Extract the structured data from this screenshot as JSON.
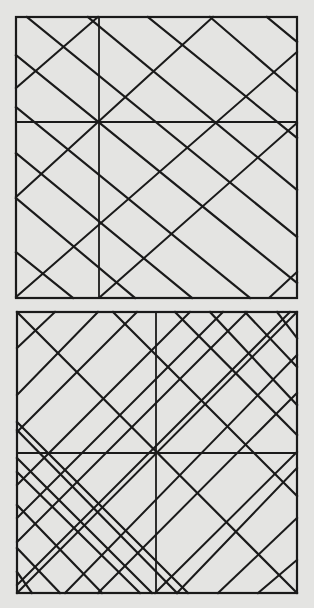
{
  "diagram": {
    "background": "#e4e4e2",
    "stroke": "#1a1a1a",
    "panels": [
      {
        "name": "top-square",
        "frame": {
          "x": 16,
          "y": 17,
          "w": 281,
          "h": 281
        },
        "dividers": [
          {
            "x1": 99,
            "y1": 17,
            "x2": 99,
            "y2": 298
          },
          {
            "x1": 16,
            "y1": 122,
            "x2": 297,
            "y2": 122
          }
        ],
        "falling_lines": [
          [
            27,
            17,
            297,
            237
          ],
          [
            16,
            55,
            297,
            283
          ],
          [
            16,
            107,
            250,
            298
          ],
          [
            16,
            153,
            192,
            298
          ],
          [
            16,
            198,
            135,
            298
          ],
          [
            16,
            252,
            73,
            298
          ],
          [
            88,
            17,
            297,
            190
          ],
          [
            148,
            17,
            297,
            138
          ],
          [
            210,
            17,
            297,
            92
          ],
          [
            267,
            17,
            297,
            42
          ]
        ],
        "rising_lines": [
          [
            16,
            88,
            98,
            17
          ],
          [
            16,
            197,
            213,
            17
          ],
          [
            16,
            297,
            297,
            52
          ],
          [
            100,
            297,
            297,
            123
          ],
          [
            270,
            297,
            297,
            272
          ]
        ]
      },
      {
        "name": "bottom-square",
        "frame": {
          "x": 17,
          "y": 312,
          "w": 280,
          "h": 281
        },
        "dividers": [
          {
            "x1": 156,
            "y1": 312,
            "x2": 156,
            "y2": 593
          },
          {
            "x1": 17,
            "y1": 453,
            "x2": 297,
            "y2": 453
          }
        ],
        "falling_lines": [
          [
            17,
            312,
            297,
            593
          ],
          [
            113,
            312,
            297,
            496
          ],
          [
            175,
            312,
            297,
            435
          ],
          [
            210,
            312,
            297,
            405
          ],
          [
            245,
            312,
            297,
            367
          ],
          [
            277,
            312,
            297,
            338
          ],
          [
            17,
            422,
            188,
            593
          ],
          [
            17,
            430,
            177,
            593
          ],
          [
            17,
            458,
            152,
            593
          ],
          [
            17,
            472,
            140,
            593
          ],
          [
            17,
            505,
            102,
            593
          ],
          [
            17,
            548,
            60,
            593
          ],
          [
            17,
            572,
            32,
            593
          ]
        ],
        "rising_lines": [
          [
            17,
            348,
            55,
            312
          ],
          [
            17,
            395,
            98,
            312
          ],
          [
            17,
            432,
            137,
            312
          ],
          [
            17,
            593,
            297,
            312
          ],
          [
            17,
            485,
            190,
            312
          ],
          [
            17,
            518,
            223,
            312
          ],
          [
            17,
            542,
            247,
            312
          ],
          [
            17,
            585,
            290,
            312
          ],
          [
            65,
            593,
            297,
            355
          ],
          [
            98,
            593,
            297,
            393
          ],
          [
            155,
            593,
            297,
            452
          ],
          [
            177,
            593,
            297,
            468
          ],
          [
            218,
            593,
            297,
            518
          ],
          [
            258,
            593,
            297,
            560
          ]
        ]
      }
    ]
  }
}
